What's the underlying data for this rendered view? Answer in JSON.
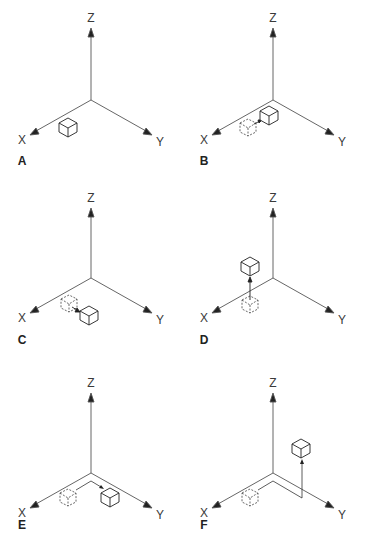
{
  "figure": {
    "axis_labels": {
      "x": "X",
      "y": "Y",
      "z": "Z"
    },
    "colors": {
      "line": "#555555",
      "box": "#222222",
      "dashed_box": "#444444",
      "text": "#333333"
    },
    "panels": [
      {
        "id": "A",
        "letter": "A",
        "ox": 0,
        "oy": 0,
        "state": "box-at-start",
        "caption": "Box placed near X axis"
      },
      {
        "id": "B",
        "letter": "B",
        "ox": 182,
        "oy": 0,
        "state": "moved-minus-x",
        "caption": "Box moved toward origin along X"
      },
      {
        "id": "C",
        "letter": "C",
        "ox": 0,
        "oy": 180,
        "state": "moved-plus-y",
        "caption": "Box moved along Y"
      },
      {
        "id": "D",
        "letter": "D",
        "ox": 182,
        "oy": 180,
        "state": "moved-plus-z",
        "caption": "Box moved up along Z"
      },
      {
        "id": "E",
        "letter": "E",
        "ox": 0,
        "oy": 363,
        "state": "path-x-then-y",
        "caption": "Box moved via path along X then Y"
      },
      {
        "id": "F",
        "letter": "F",
        "ox": 182,
        "oy": 363,
        "state": "path-x-y-then-z",
        "caption": "Box moved via path along X, Y then Z"
      }
    ]
  }
}
